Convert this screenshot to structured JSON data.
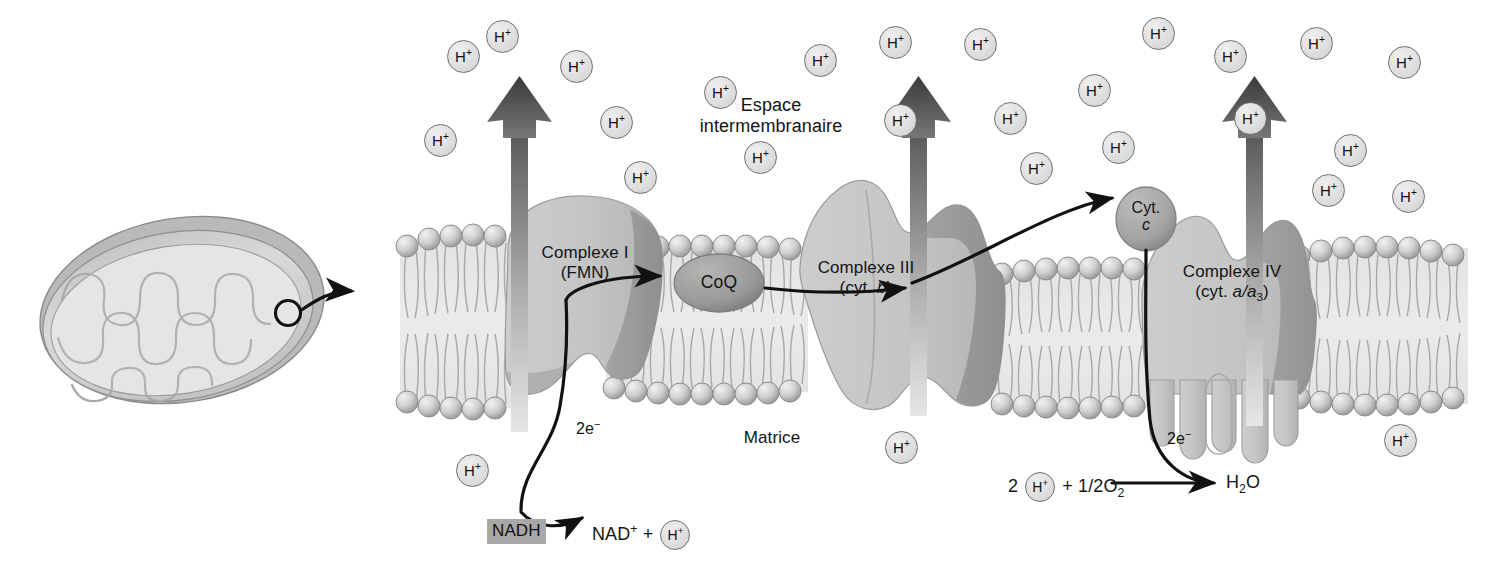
{
  "diagram": {
    "language": "fr"
  },
  "labels": {
    "espace_intermembranaire": "Espace\nintermembranaire",
    "espace_line1": "Espace",
    "espace_line2": "intermembranaire",
    "matrice": "Matrice",
    "complex_i_line1": "Complexe I",
    "complex_i_line2": "(FMN)",
    "complex_iii_line1": "Complexe III",
    "complex_iii_line2_pre": "(cyt. ",
    "complex_iii_line2_it": "b",
    "complex_iii_line2_post": ")",
    "complex_iv_line1": "Complexe IV",
    "complex_iv_line2_pre": "(cyt. ",
    "complex_iv_line2_it": "a/a",
    "complex_iv_line2_sub": "3",
    "complex_iv_line2_post": ")",
    "coq": "CoQ",
    "cytc_line1": "Cyt.",
    "cytc_line2": "c",
    "nadh": "NADH",
    "nad_plus": "NAD",
    "nad_plus_sup": "+",
    "plus_sign": "+",
    "two_e_left": "2e",
    "two_e_left_sup": "−",
    "two_e_right": "2e",
    "two_e_right_sup": "−",
    "h_plus": "H",
    "h_plus_sup": "+",
    "rx_two": "2",
    "rx_plus": "+",
    "rx_half_o2_pre": "1/2O",
    "rx_half_o2_sub": "2",
    "rx_water_pre": "H",
    "rx_water_sub": "2",
    "rx_water_post": "O"
  },
  "protons": {
    "symbol": "H+",
    "intermembrane_count": 24,
    "matrix_count": 3,
    "positions_intermembrane": [
      {
        "x": 440,
        "y": 140
      },
      {
        "x": 463,
        "y": 56
      },
      {
        "x": 502,
        "y": 36
      },
      {
        "x": 576,
        "y": 66
      },
      {
        "x": 616,
        "y": 122
      },
      {
        "x": 640,
        "y": 177
      },
      {
        "x": 720,
        "y": 92
      },
      {
        "x": 760,
        "y": 157
      },
      {
        "x": 820,
        "y": 60
      },
      {
        "x": 895,
        "y": 42
      },
      {
        "x": 900,
        "y": 120
      },
      {
        "x": 980,
        "y": 44
      },
      {
        "x": 1010,
        "y": 118
      },
      {
        "x": 1036,
        "y": 168
      },
      {
        "x": 1094,
        "y": 90
      },
      {
        "x": 1118,
        "y": 147
      },
      {
        "x": 1158,
        "y": 33
      },
      {
        "x": 1230,
        "y": 56
      },
      {
        "x": 1250,
        "y": 118
      },
      {
        "x": 1316,
        "y": 43
      },
      {
        "x": 1328,
        "y": 190
      },
      {
        "x": 1408,
        "y": 196
      },
      {
        "x": 1404,
        "y": 62
      },
      {
        "x": 1350,
        "y": 150
      }
    ],
    "positions_matrix": [
      {
        "x": 472,
        "y": 470
      },
      {
        "x": 901,
        "y": 447
      },
      {
        "x": 1400,
        "y": 440
      }
    ]
  },
  "pumps": {
    "count": 3,
    "description": "proton pump arrows pointing up through complexes",
    "x_positions": [
      519,
      918,
      1254
    ]
  },
  "electron_flow": [
    {
      "from": "NADH",
      "to": "Complexe I",
      "label": "2e-"
    },
    {
      "from": "Complexe I",
      "to": "CoQ",
      "label": ""
    },
    {
      "from": "CoQ",
      "to": "Complexe III",
      "label": ""
    },
    {
      "from": "Complexe III",
      "to": "Cyt. c",
      "label": ""
    },
    {
      "from": "Cyt. c",
      "to": "Complexe IV",
      "label": "2e-"
    },
    {
      "from": "Complexe IV",
      "to": "H2O",
      "label": ""
    }
  ],
  "colors": {
    "complex_fill": "#c8c8c8",
    "complex_shadow": "#8f8f8f",
    "complex_dark": "#9e9e9e",
    "membrane_fill": "#dcdcdc",
    "head_group": "#c9c9c9",
    "coq_fill": "#9a9a9a",
    "cytc_fill": "#a5a5a5",
    "arrow_stroke": "#111111",
    "nadh_bg": "#a8a8a8",
    "mito_outer": "#b4b4b4",
    "mito_inner": "#d8d8d8",
    "background": "#ffffff"
  },
  "mitochondrion": {
    "name": "mitochondrion-overview",
    "callout": "magnification arrow to inner membrane detail"
  }
}
